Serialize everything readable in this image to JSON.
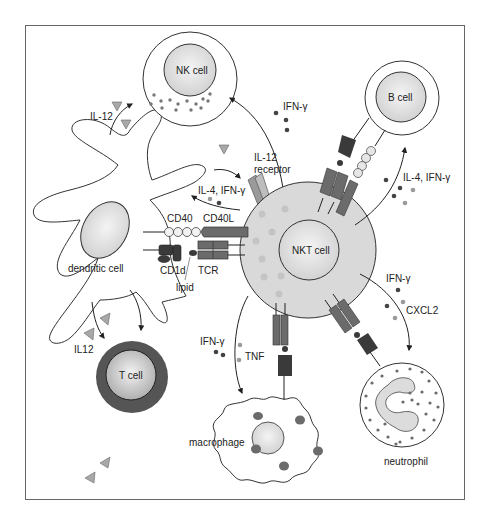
{
  "diagram": {
    "cells": {
      "nk_cell": "NK cell",
      "b_cell": "B cell",
      "nkt_cell": "NKT cell",
      "t_cell": "T cell",
      "dendritic_cell": "dendritic cell",
      "macrophage": "macrophage",
      "neutrophil": "neutrophil"
    },
    "molecules": {
      "il12_top": "IL-12",
      "il12_receptor_line1": "IL-12",
      "il12_receptor_line2": "receptor",
      "ifn_top": "IFN-γ",
      "il4_ifn_left": "IL-4, IFN-γ",
      "il4_ifn_right": "IL-4, IFN-γ",
      "cd40": "CD40",
      "cd40l": "CD40L",
      "cd1d": "CD1d",
      "tcr": "TCR",
      "lipid": "lipid",
      "il12_bottom": "IL12",
      "ifn_macrophage": "IFN-γ",
      "tnf": "TNF",
      "ifn_neutrophil": "IFN-γ",
      "cxcl2": "CXCL2"
    },
    "colors": {
      "cell_fill": "#d9d9d9",
      "cell_outline": "#333333",
      "dark_receptor": "#3a3a3a",
      "mid_receptor": "#6b6b6b",
      "light_bead": "#e6e6e6",
      "tcell_outer": "#555555",
      "cytokine_dark": "#444444",
      "cytokine_light": "#9a9a9a",
      "il12_triangle": "#a8a8a8"
    }
  }
}
